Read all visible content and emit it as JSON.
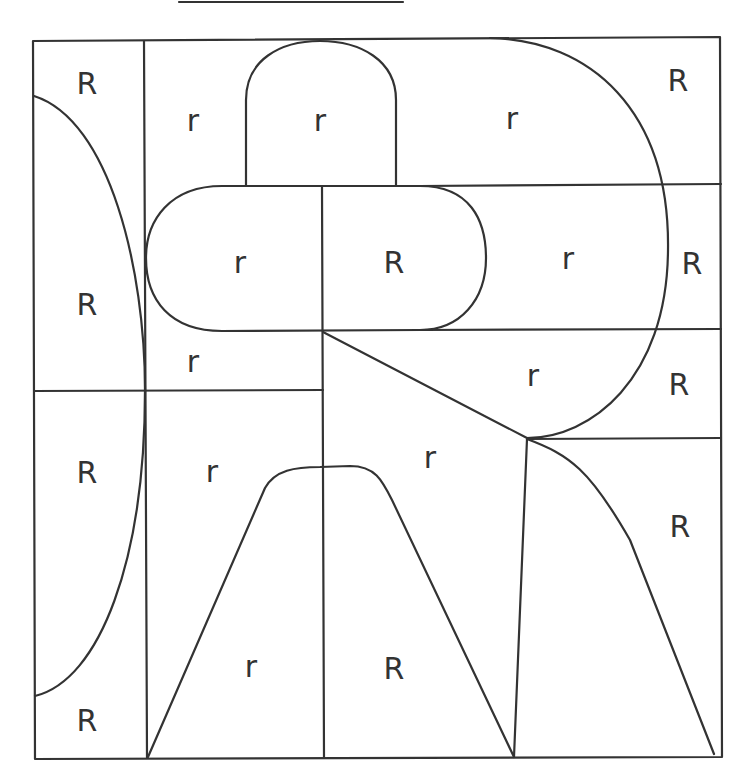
{
  "diagram": {
    "title_line": true,
    "stroke_color": "#333333",
    "background": "#ffffff",
    "regions": [
      {
        "id": "left-top",
        "label": "R",
        "x": 87,
        "y": 85
      },
      {
        "id": "left-mid",
        "label": "R",
        "x": 87,
        "y": 306
      },
      {
        "id": "left-lower",
        "label": "R",
        "x": 87,
        "y": 474
      },
      {
        "id": "left-bottom",
        "label": "R",
        "x": 87,
        "y": 722
      },
      {
        "id": "top-col2",
        "label": "r",
        "x": 193,
        "y": 122
      },
      {
        "id": "top-dome",
        "label": "r",
        "x": 320,
        "y": 122
      },
      {
        "id": "top-big-curve",
        "label": "r",
        "x": 512,
        "y": 120
      },
      {
        "id": "top-right",
        "label": "R",
        "x": 678,
        "y": 82
      },
      {
        "id": "pill-left",
        "label": "r",
        "x": 240,
        "y": 264
      },
      {
        "id": "pill-right",
        "label": "R",
        "x": 394,
        "y": 264
      },
      {
        "id": "mid-curve",
        "label": "r",
        "x": 568,
        "y": 260
      },
      {
        "id": "mid-right",
        "label": "R",
        "x": 692,
        "y": 265
      },
      {
        "id": "col2-strip",
        "label": "r",
        "x": 193,
        "y": 363
      },
      {
        "id": "wedge",
        "label": "r",
        "x": 533,
        "y": 377
      },
      {
        "id": "right-band",
        "label": "R",
        "x": 679,
        "y": 386
      },
      {
        "id": "lower-col2",
        "label": "r",
        "x": 212,
        "y": 473
      },
      {
        "id": "lower-center",
        "label": "r",
        "x": 430,
        "y": 459
      },
      {
        "id": "lower-right",
        "label": "R",
        "x": 680,
        "y": 528
      },
      {
        "id": "hill-left",
        "label": "r",
        "x": 251,
        "y": 668
      },
      {
        "id": "hill-right",
        "label": "R",
        "x": 394,
        "y": 670
      }
    ]
  }
}
